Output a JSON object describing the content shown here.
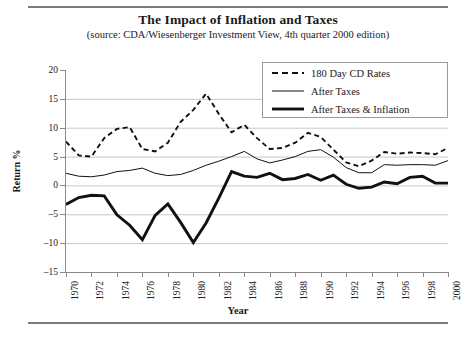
{
  "figure": {
    "title": "The Impact of Inflation and Taxes",
    "subtitle": "(source: CDA/Wiesenberger Investment View, 4th quarter 2000 edition)"
  },
  "axes": {
    "y_title": "Return %",
    "x_title": "Year",
    "y_ticks": [
      "20",
      "15",
      "10",
      "5",
      "0",
      "-5",
      "-10",
      "-15"
    ],
    "x_ticks": [
      "1970",
      "1972",
      "1974",
      "1976",
      "1978",
      "1980",
      "1982",
      "1984",
      "1986",
      "1988",
      "1990",
      "1992",
      "1994",
      "1996",
      "1998",
      "2000"
    ]
  },
  "legend": {
    "items": [
      {
        "label": "180 Day CD Rates",
        "style": "dashed",
        "color": "#111111"
      },
      {
        "label": "After Taxes",
        "style": "thin",
        "color": "#111111"
      },
      {
        "label": "After Taxes & Inflation",
        "style": "thick",
        "color": "#111111"
      }
    ]
  },
  "chart_data": {
    "type": "line",
    "title": "The Impact of Inflation and Taxes",
    "subtitle": "(source: CDA/Wiesenberger Investment View, 4th quarter 2000 edition)",
    "xlabel": "Year",
    "ylabel": "Return %",
    "xlim": [
      1970,
      2000
    ],
    "ylim": [
      -15,
      20
    ],
    "ytick_step": 5,
    "grid": "horizontal",
    "legend_position": "top-right",
    "x": [
      1970,
      1971,
      1972,
      1973,
      1974,
      1975,
      1976,
      1977,
      1978,
      1979,
      1980,
      1981,
      1982,
      1983,
      1984,
      1985,
      1986,
      1987,
      1988,
      1989,
      1990,
      1991,
      1992,
      1993,
      1994,
      1995,
      1996,
      1997,
      1998,
      1999,
      2000
    ],
    "series": [
      {
        "name": "180 Day CD Rates",
        "style": "dashed",
        "color": "#111111",
        "values": [
          7.6,
          5.2,
          5.0,
          8.2,
          9.8,
          10.1,
          6.3,
          5.9,
          7.4,
          11.0,
          13.1,
          15.9,
          12.4,
          9.2,
          10.5,
          8.2,
          6.3,
          6.5,
          7.4,
          9.1,
          8.4,
          6.2,
          4.0,
          3.3,
          4.3,
          5.8,
          5.5,
          5.7,
          5.6,
          5.4,
          6.5
        ]
      },
      {
        "name": "After Taxes",
        "style": "thin",
        "color": "#111111",
        "values": [
          2.1,
          1.6,
          1.5,
          1.8,
          2.4,
          2.6,
          3.0,
          2.1,
          1.7,
          1.9,
          2.6,
          3.5,
          4.2,
          5.0,
          5.9,
          4.6,
          3.9,
          4.4,
          5.0,
          5.9,
          6.2,
          4.9,
          3.1,
          2.2,
          2.2,
          3.6,
          3.5,
          3.6,
          3.6,
          3.5,
          4.3
        ]
      },
      {
        "name": "After Taxes & Inflation",
        "style": "thick",
        "color": "#111111",
        "values": [
          -3.3,
          -2.1,
          -1.7,
          -1.8,
          -5.1,
          -6.9,
          -9.4,
          -5.2,
          -3.2,
          -6.4,
          -9.9,
          -6.5,
          -2.2,
          2.4,
          1.6,
          1.4,
          2.1,
          1.0,
          1.2,
          1.9,
          0.9,
          1.8,
          0.2,
          -0.5,
          -0.3,
          0.6,
          0.3,
          1.4,
          1.6,
          0.4,
          0.4
        ]
      }
    ]
  }
}
